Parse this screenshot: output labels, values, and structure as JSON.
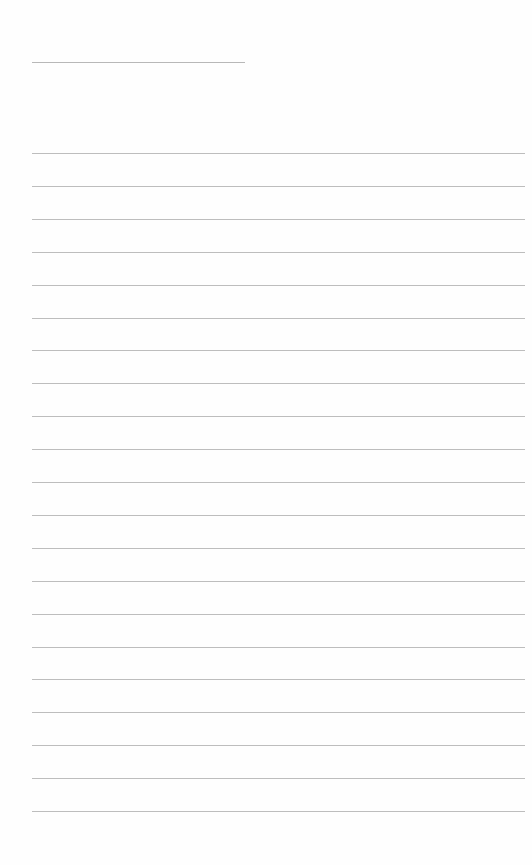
{
  "page": {
    "type": "lined-paper",
    "background_color": "#fefefe",
    "line_color": "#bdbdbd",
    "title_line": {
      "present": true,
      "text": ""
    },
    "ruled_lines": {
      "count": 21,
      "first_y": 153,
      "spacing": 32.9,
      "texts": [
        "",
        "",
        "",
        "",
        "",
        "",
        "",
        "",
        "",
        "",
        "",
        "",
        "",
        "",
        "",
        "",
        "",
        "",
        "",
        "",
        ""
      ]
    }
  }
}
